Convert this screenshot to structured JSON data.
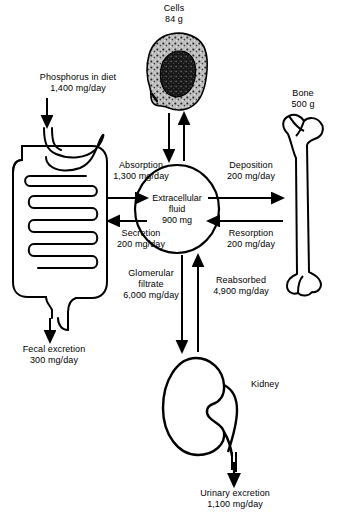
{
  "diagram": {
    "nodes": [
      {
        "name": "cells",
        "label": "Cells\n84 g"
      },
      {
        "name": "bone",
        "label": "Bone\n500 g"
      },
      {
        "name": "kidney",
        "label": "Kidney"
      },
      {
        "name": "ecf",
        "label": "Extracellular\nfluid\n900 mg"
      },
      {
        "name": "gi-tract",
        "label": ""
      }
    ],
    "flows": [
      {
        "name": "phosphorus-in-diet",
        "label": "Phosphorus in diet\n1,400 mg/day"
      },
      {
        "name": "absorption",
        "label": "Absorption\n1,300 mg/day"
      },
      {
        "name": "secretion",
        "label": "Secretion\n200 mg/day"
      },
      {
        "name": "fecal-excretion",
        "label": "Fecal excretion\n300 mg/day"
      },
      {
        "name": "deposition",
        "label": "Deposition\n200 mg/day"
      },
      {
        "name": "resorption",
        "label": "Resorption\n200 mg/day"
      },
      {
        "name": "glomerular-filtrate",
        "label": "Glomerular\nfiltrate\n6,000 mg/day"
      },
      {
        "name": "reabsorbed",
        "label": "Reabsorbed\n4,900 mg/day"
      },
      {
        "name": "urinary-excretion",
        "label": "Urinary excretion\n1,100 mg/day"
      }
    ],
    "colors": {
      "ink": "#000000",
      "paper": "#ffffff",
      "cytoplasm": "#b9b9b9",
      "nucleus": "#1a1a1a"
    }
  }
}
